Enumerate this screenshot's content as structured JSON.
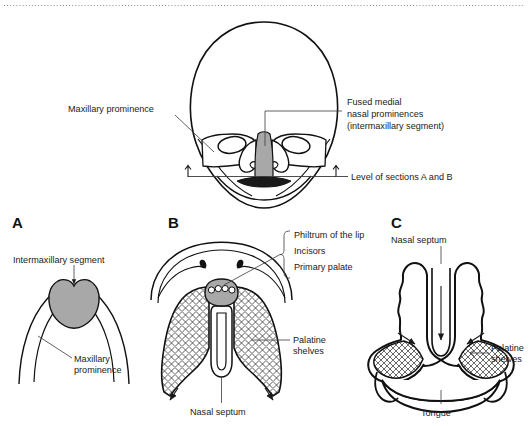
{
  "figure": {
    "background_color": "#ffffff",
    "ink_color": "#111111",
    "shade_color": "#a8a8a8",
    "leader_color": "#3a3a3a",
    "divider": {
      "name": "top-dotted-rule",
      "style": "dotted",
      "color": "#8a8a8a"
    }
  },
  "top_panel": {
    "name": "frontal-face-view",
    "labels": {
      "maxillary_prominence": "Maxillary prominence",
      "fused_medial_line1": "Fused medial",
      "fused_medial_line2": "nasal prominences",
      "fused_medial_line3": "(intermaxillary segment)",
      "section_level": "Level of sections A and B"
    }
  },
  "panels": [
    {
      "letter": "A",
      "name": "panel-a-early-palate",
      "labels": {
        "intermaxillary_segment": "Intermaxillary segment",
        "maxillary_line1": "Maxillary",
        "maxillary_line2": "prominence"
      }
    },
    {
      "letter": "B",
      "name": "panel-b-palate-inferior-view",
      "labels": {
        "philtrum": "Philtrum of the lip",
        "incisors": "Incisors",
        "primary_palate": "Primary palate",
        "palatine_line1": "Palatine",
        "palatine_line2": "shelves",
        "nasal_septum": "Nasal septum"
      }
    },
    {
      "letter": "C",
      "name": "panel-c-coronal-section",
      "labels": {
        "nasal_septum": "Nasal septum",
        "palatine_line1": "Palatine",
        "palatine_line2": "shelves",
        "tongue": "Tongue"
      }
    }
  ]
}
